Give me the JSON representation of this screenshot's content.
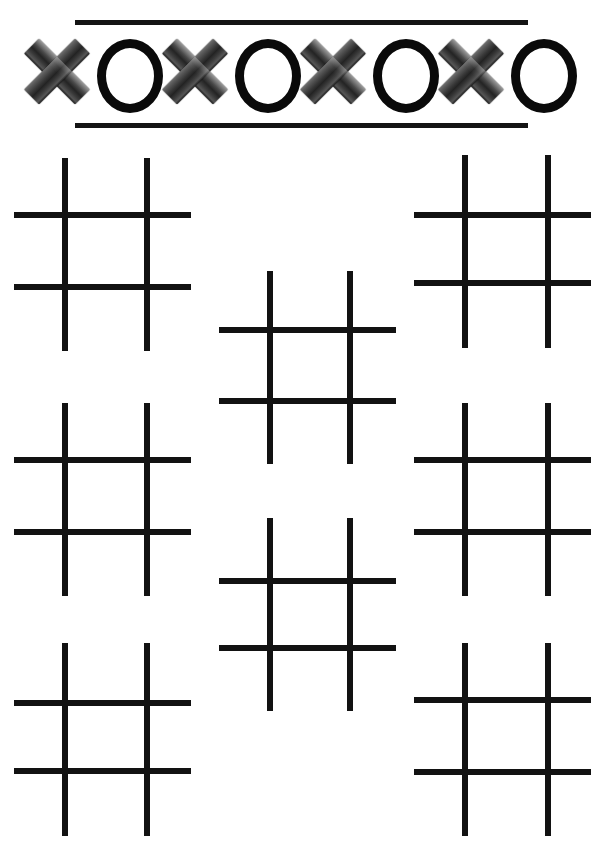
{
  "page": {
    "width": 605,
    "height": 848,
    "background_color": "#ffffff"
  },
  "header": {
    "name": "xo-banner",
    "rule_color": "#141414",
    "rules": [
      {
        "name": "banner-rule-top",
        "x": 75,
        "y": 20,
        "width": 453,
        "height": 5
      },
      {
        "name": "banner-rule-bottom",
        "x": 75,
        "y": 123,
        "width": 453,
        "height": 5
      }
    ],
    "sequence": [
      "X",
      "O",
      "X",
      "O",
      "X",
      "O",
      "X",
      "O"
    ],
    "symbols": [
      {
        "type": "X",
        "name": "x-mark-icon-1",
        "style": "metallic-gradient",
        "color": "#3a3a3a"
      },
      {
        "type": "O",
        "name": "o-mark-icon-1",
        "style": "solid-ring",
        "color": "#0a0a0a"
      },
      {
        "type": "X",
        "name": "x-mark-icon-2",
        "style": "metallic-gradient",
        "color": "#3a3a3a"
      },
      {
        "type": "O",
        "name": "o-mark-icon-2",
        "style": "solid-ring",
        "color": "#0a0a0a"
      },
      {
        "type": "X",
        "name": "x-mark-icon-3",
        "style": "metallic-gradient",
        "color": "#3a3a3a"
      },
      {
        "type": "O",
        "name": "o-mark-icon-3",
        "style": "solid-ring",
        "color": "#0a0a0a"
      },
      {
        "type": "X",
        "name": "x-mark-icon-4",
        "style": "metallic-gradient",
        "color": "#3a3a3a"
      },
      {
        "type": "O",
        "name": "o-mark-icon-4",
        "style": "solid-ring",
        "color": "#0a0a0a"
      }
    ]
  },
  "boards": {
    "count": 8,
    "line_color": "#121212",
    "line_thickness": 6,
    "cells_per_board": 9,
    "all_cells_empty": true,
    "items": [
      {
        "name": "tic-tac-toe-board-1",
        "position": "left-top",
        "x": 14,
        "y": 158,
        "width": 177,
        "height": 193,
        "v_offsets": [
          48,
          130
        ],
        "h_offsets": [
          54,
          126
        ],
        "v_span": [
          0,
          193
        ],
        "h_span": [
          0,
          177
        ]
      },
      {
        "name": "tic-tac-toe-board-2",
        "position": "center-upper",
        "x": 219,
        "y": 271,
        "width": 177,
        "height": 193,
        "v_offsets": [
          48,
          128
        ],
        "h_offsets": [
          56,
          127
        ],
        "v_span": [
          0,
          193
        ],
        "h_span": [
          0,
          177
        ]
      },
      {
        "name": "tic-tac-toe-board-3",
        "position": "right-top",
        "x": 414,
        "y": 155,
        "width": 177,
        "height": 193,
        "v_offsets": [
          48,
          131
        ],
        "h_offsets": [
          57,
          125
        ],
        "v_span": [
          0,
          193
        ],
        "h_span": [
          0,
          177
        ]
      },
      {
        "name": "tic-tac-toe-board-4",
        "position": "left-middle",
        "x": 14,
        "y": 403,
        "width": 177,
        "height": 193,
        "v_offsets": [
          48,
          130
        ],
        "h_offsets": [
          54,
          126
        ],
        "v_span": [
          0,
          193
        ],
        "h_span": [
          0,
          177
        ]
      },
      {
        "name": "tic-tac-toe-board-5",
        "position": "center-lower",
        "x": 219,
        "y": 518,
        "width": 177,
        "height": 193,
        "v_offsets": [
          48,
          128
        ],
        "h_offsets": [
          60,
          127
        ],
        "v_span": [
          0,
          193
        ],
        "h_span": [
          0,
          177
        ]
      },
      {
        "name": "tic-tac-toe-board-6",
        "position": "right-middle",
        "x": 414,
        "y": 403,
        "width": 177,
        "height": 193,
        "v_offsets": [
          48,
          131
        ],
        "h_offsets": [
          54,
          126
        ],
        "v_span": [
          0,
          193
        ],
        "h_span": [
          0,
          177
        ]
      },
      {
        "name": "tic-tac-toe-board-7",
        "position": "left-bottom",
        "x": 14,
        "y": 643,
        "width": 177,
        "height": 193,
        "v_offsets": [
          48,
          130
        ],
        "h_offsets": [
          57,
          125
        ],
        "v_span": [
          0,
          193
        ],
        "h_span": [
          0,
          177
        ]
      },
      {
        "name": "tic-tac-toe-board-8",
        "position": "right-bottom",
        "x": 414,
        "y": 643,
        "width": 177,
        "height": 193,
        "v_offsets": [
          48,
          131
        ],
        "h_offsets": [
          54,
          126
        ],
        "v_span": [
          0,
          193
        ],
        "h_span": [
          0,
          177
        ]
      }
    ]
  }
}
